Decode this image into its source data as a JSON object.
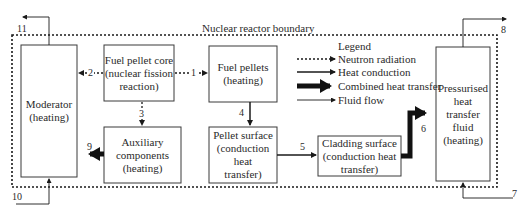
{
  "boundary": {
    "label": "Nuclear reactor boundary"
  },
  "boxes": {
    "moderator": {
      "line1": "Moderator",
      "line2": "(heating)"
    },
    "fuel_core": {
      "line1": "Fuel pellet core",
      "line2": "(nuclear fission",
      "line3": "reaction)"
    },
    "fuel_pellets": {
      "line1": "Fuel pellets",
      "line2": "(heating)"
    },
    "auxiliary": {
      "line1": "Auxiliary",
      "line2": "components",
      "line3": "(heating)"
    },
    "pellet_surface": {
      "line1": "Pellet surface",
      "line2": "(conduction heat",
      "line3": "transfer)"
    },
    "cladding": {
      "line1": "Cladding surface",
      "line2": "(conduction heat",
      "line3": "transfer)"
    },
    "fluid": {
      "line1": "Pressurised",
      "line2": "heat",
      "line3": "transfer",
      "line4": "fluid",
      "line5": "(heating)"
    }
  },
  "legend": {
    "title": "Legend",
    "items": [
      {
        "label": "Neutron radiation",
        "style": "dotted"
      },
      {
        "label": "Heat conduction",
        "style": "solid"
      },
      {
        "label": "Combined heat transfer",
        "style": "thick"
      },
      {
        "label": "Fluid flow",
        "style": "thin"
      }
    ]
  },
  "flows": {
    "n1": "1",
    "n2": "2",
    "n3": "3",
    "n4": "4",
    "n5": "5",
    "n6": "6",
    "n7": "7",
    "n8": "8",
    "n9": "9",
    "n10": "10",
    "n11": "11"
  },
  "colors": {
    "line": "#1a1a1a",
    "box_border": "#3a3a3a",
    "background": "#ffffff"
  }
}
